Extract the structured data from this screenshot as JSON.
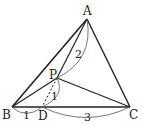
{
  "diagram": {
    "points": {
      "A": {
        "label": "A",
        "x": 87,
        "y": 19
      },
      "B": {
        "label": "B",
        "x": 12,
        "y": 107
      },
      "C": {
        "label": "C",
        "x": 130,
        "y": 107
      },
      "P": {
        "label": "P",
        "x": 57,
        "y": 78
      },
      "D": {
        "label": "D",
        "x": 42,
        "y": 107
      }
    },
    "segments": [
      "AB",
      "AC",
      "BC",
      "AP",
      "BP",
      "CP",
      "PD(dashed)"
    ],
    "measurements": {
      "AP": "2",
      "PD": "1",
      "BD": "1",
      "DC": "3"
    }
  }
}
